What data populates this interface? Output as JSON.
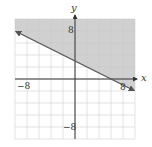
{
  "chart_data": {
    "type": "line",
    "title": "",
    "xlabel": "x",
    "ylabel": "y",
    "xlim": [
      -10,
      10
    ],
    "ylim": [
      -10,
      10
    ],
    "grid": true,
    "grid_step": 2,
    "tick_labels": {
      "x": [
        {
          "value": -8,
          "label": "−8"
        },
        {
          "value": 8,
          "label": "8"
        }
      ],
      "y": [
        {
          "value": 8,
          "label": "8"
        },
        {
          "value": -8,
          "label": "−8"
        }
      ]
    },
    "boundary_line": {
      "equation": "y = -x/2 + 3",
      "slope": -0.5,
      "intercept": 3,
      "style": "solid",
      "points": [
        [
          -10,
          8
        ],
        [
          0,
          3
        ],
        [
          6,
          0
        ],
        [
          10,
          -2
        ]
      ]
    },
    "shaded_region": "above",
    "inequality": "x + 2y ≥ 6",
    "colors": {
      "shade": "#c8c8c8",
      "line": "#555555",
      "grid": "#dcdcdc",
      "axis": "#333333"
    }
  },
  "labels": {
    "x_axis": "x",
    "y_axis": "y",
    "x_neg": "−8",
    "x_pos": "8",
    "y_pos": "8",
    "y_neg": "−8"
  }
}
